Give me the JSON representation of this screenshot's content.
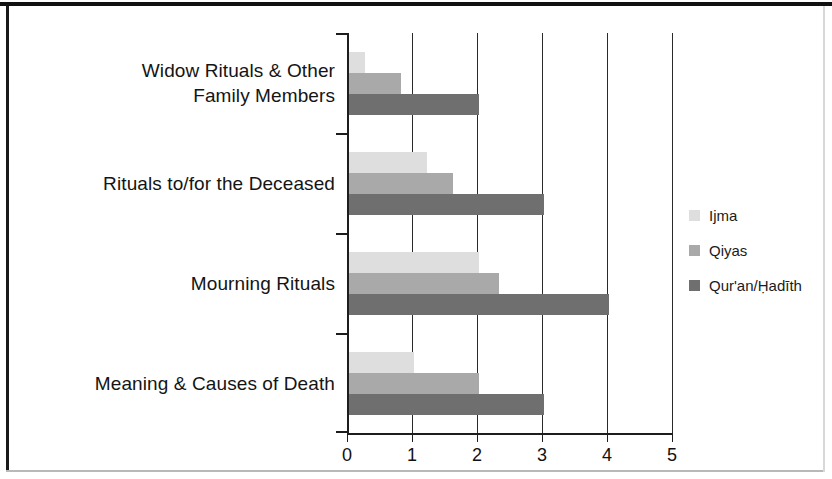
{
  "chart_data": {
    "type": "bar",
    "orientation": "horizontal",
    "title": "",
    "xlabel": "",
    "ylabel": "",
    "xlim": [
      0,
      5
    ],
    "xticks": [
      "0",
      "1",
      "2",
      "3",
      "4",
      "5"
    ],
    "grid": true,
    "legend_position": "right",
    "categories": [
      "Widow Rituals & Other Family Members",
      "Rituals to/for the Deceased",
      "Mourning Rituals",
      "Meaning & Causes of Death"
    ],
    "category_lines": [
      [
        "Widow Rituals & Other",
        "Family Members"
      ],
      [
        "Rituals to/for the Deceased"
      ],
      [
        "Mourning Rituals"
      ],
      [
        "Meaning & Causes of Death"
      ]
    ],
    "series": [
      {
        "name": "Ijma",
        "color": "#dedede",
        "values": [
          0.25,
          1.2,
          2.0,
          1.0
        ]
      },
      {
        "name": "Qiyas",
        "color": "#a9a9a9",
        "values": [
          0.8,
          1.6,
          2.3,
          2.0
        ]
      },
      {
        "name": "Qur'an/Ḥadīth",
        "color": "#6f6f6f",
        "values": [
          2.0,
          3.0,
          4.0,
          3.0
        ]
      }
    ]
  },
  "legend": {
    "items": [
      {
        "label": "Ijma",
        "color": "#dedede"
      },
      {
        "label": "Qiyas",
        "color": "#a9a9a9"
      },
      {
        "label": "Qur'an/Ḥadīth",
        "color": "#6f6f6f"
      }
    ]
  },
  "axis": {
    "x_tick_labels": [
      "0",
      "1",
      "2",
      "3",
      "4",
      "5"
    ]
  }
}
